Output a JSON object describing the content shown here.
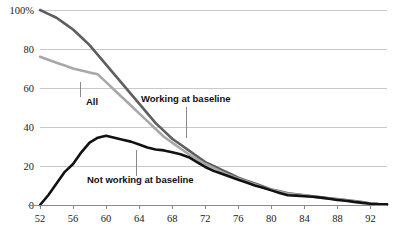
{
  "chart_data": {
    "type": "line",
    "title": "",
    "subtitle": "",
    "xlabel": "",
    "ylabel": "",
    "xlim": [
      52,
      94
    ],
    "ylim": [
      0,
      100
    ],
    "grid": true,
    "legend_position": "inline-annotations",
    "x_ticks": [
      52,
      56,
      60,
      64,
      68,
      72,
      76,
      80,
      84,
      88,
      92
    ],
    "x_tick_labels": [
      "52",
      "56",
      "60",
      "64",
      "68",
      "72",
      "76",
      "80",
      "84",
      "88",
      "92"
    ],
    "y_ticks": [
      0,
      20,
      40,
      60,
      80,
      100
    ],
    "y_tick_labels": [
      "0",
      "20",
      "40",
      "60",
      "80",
      "100%"
    ],
    "series": [
      {
        "name": "Working at baseline",
        "color": "#5e5e5e",
        "width": 2.6,
        "x": [
          52,
          53,
          54,
          55,
          56,
          57,
          58,
          59,
          60,
          61,
          62,
          63,
          64,
          65,
          66,
          67,
          68,
          69,
          70,
          71,
          72,
          73,
          74,
          75,
          76,
          77,
          78,
          79,
          80,
          81,
          82,
          83,
          84,
          85,
          86,
          87,
          88,
          89,
          90,
          91,
          92,
          93,
          94
        ],
        "values": [
          100,
          98,
          96,
          93,
          90,
          86,
          82,
          77,
          72,
          67,
          62,
          57,
          52,
          47,
          42,
          38,
          34,
          31,
          28,
          25,
          22,
          20,
          18,
          16,
          14,
          12.5,
          11,
          9.5,
          8,
          7,
          6,
          5.5,
          5,
          4.5,
          4,
          3.5,
          3,
          2.5,
          2,
          1.5,
          0.8,
          0.5,
          0.4
        ]
      },
      {
        "name": "All",
        "color": "#a8a8a8",
        "width": 2.6,
        "x": [
          52,
          53,
          54,
          55,
          56,
          57,
          58,
          59,
          60,
          61,
          62,
          63,
          64,
          65,
          66,
          67,
          68,
          69,
          70,
          71,
          72,
          73,
          74,
          75,
          76,
          77,
          78,
          79,
          80,
          81,
          82,
          83,
          84,
          85,
          86,
          87,
          88,
          89,
          90,
          91,
          92,
          93,
          94
        ],
        "values": [
          76,
          74.5,
          73,
          71.5,
          70,
          69,
          68,
          67,
          63,
          59,
          55,
          51,
          47,
          43,
          39,
          35,
          32,
          29,
          26,
          23.5,
          21,
          19,
          17,
          15,
          13.5,
          12,
          10.5,
          9,
          7.8,
          6.8,
          5.8,
          5.3,
          4.8,
          4.3,
          3.8,
          3.3,
          2.8,
          2.4,
          1.9,
          1.4,
          0.8,
          0.5,
          0.4
        ]
      },
      {
        "name": "Not working at baseline",
        "color": "#111111",
        "width": 2.6,
        "x": [
          52,
          53,
          54,
          55,
          56,
          57,
          58,
          59,
          60,
          61,
          62,
          63,
          64,
          65,
          66,
          67,
          68,
          69,
          70,
          71,
          72,
          73,
          74,
          75,
          76,
          77,
          78,
          79,
          80,
          81,
          82,
          83,
          84,
          85,
          86,
          87,
          88,
          89,
          90,
          91,
          92,
          93,
          94
        ],
        "values": [
          0,
          5,
          11,
          17,
          21,
          27,
          32,
          34.5,
          35.5,
          34.5,
          33.5,
          32.5,
          31,
          29.5,
          28.5,
          28,
          27,
          26,
          24.5,
          22,
          19.5,
          17.5,
          16,
          14.5,
          13,
          11.5,
          10,
          8.8,
          7.5,
          6.2,
          5,
          4.8,
          4.5,
          4.2,
          3.8,
          3.2,
          2.6,
          2.2,
          1.6,
          1.1,
          0.6,
          0.4,
          0.3
        ]
      }
    ],
    "annotations": [
      {
        "text": "All",
        "text_x": 86,
        "text_y": 105,
        "leader_x": 80,
        "leader_y1": 82,
        "leader_y2": 97,
        "series": "All"
      },
      {
        "text": "Working at baseline",
        "text_x": 141,
        "text_y": 102,
        "leader_x": 186,
        "leader_y1": 107,
        "leader_y2": 138,
        "series": "Working at baseline"
      },
      {
        "text": "Not working at baseline",
        "text_x": 87,
        "text_y": 183,
        "leader_x": 136,
        "leader_y1": 150,
        "leader_y2": 176,
        "series": "Not working at baseline"
      }
    ]
  },
  "geometry": {
    "plot_left": 40,
    "plot_right": 387,
    "plot_top": 10,
    "plot_bottom": 205
  }
}
